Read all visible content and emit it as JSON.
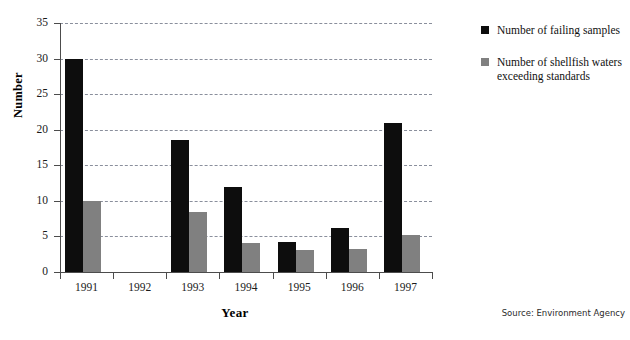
{
  "chart_data": {
    "type": "bar",
    "title": "",
    "xlabel": "Year",
    "ylabel": "Number",
    "categories": [
      "1991",
      "1992",
      "1993",
      "1994",
      "1995",
      "1996",
      "1997"
    ],
    "series": [
      {
        "name": "Number of failing samples",
        "color": "#0d0d0d",
        "values": [
          30,
          0,
          18.6,
          12,
          4.2,
          6.2,
          21
        ]
      },
      {
        "name": "Number of shellfish waters exceeding standards",
        "color": "#808080",
        "values": [
          10,
          0,
          8.4,
          4.1,
          3.1,
          3.3,
          5.2
        ]
      }
    ],
    "ylim": [
      0,
      35
    ],
    "ytick_values": [
      0,
      5,
      10,
      15,
      20,
      25,
      30,
      35
    ],
    "ytick_labels": [
      "0",
      "5",
      "10",
      "15",
      "20",
      "25",
      "30",
      "35"
    ],
    "grid": "horizontal-dashed",
    "legend_position": "right-top",
    "legend_entries": [
      {
        "label": "Number of failing samples",
        "color": "#0d0d0d"
      },
      {
        "label": "Number of shellfish waters exceeding standards",
        "color": "#808080"
      }
    ],
    "legend_entry_lines": [
      [
        "Number of failing samples"
      ],
      [
        "Number of shellfish waters",
        "exceeding standards"
      ]
    ],
    "source_note": "Source: Environment Agency"
  }
}
